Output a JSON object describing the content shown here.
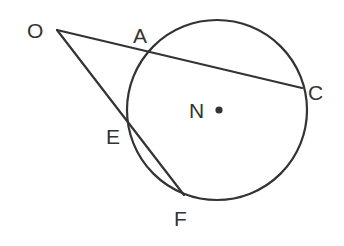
{
  "diagram": {
    "type": "geometry-circle-secants",
    "stroke_color": "#333333",
    "background": "#ffffff",
    "circle": {
      "center_label": "N",
      "cx": 217,
      "cy": 110,
      "r": 90
    },
    "points": {
      "O": {
        "label": "O",
        "x": 57,
        "y": 30
      },
      "A": {
        "label": "A",
        "x": 148,
        "y": 50
      },
      "C": {
        "label": "C",
        "x": 302,
        "y": 88
      },
      "E": {
        "label": "E",
        "x": 128,
        "y": 123
      },
      "F": {
        "label": "F",
        "x": 184,
        "y": 195
      },
      "N": {
        "label": "N",
        "x": 217,
        "y": 110
      }
    },
    "segments": [
      {
        "from": "O",
        "to": "C",
        "through": "A"
      },
      {
        "from": "O",
        "to": "F",
        "through": "E"
      }
    ],
    "labels": {
      "O": "O",
      "A": "A",
      "C": "C",
      "E": "E",
      "F": "F",
      "N": "N"
    }
  }
}
